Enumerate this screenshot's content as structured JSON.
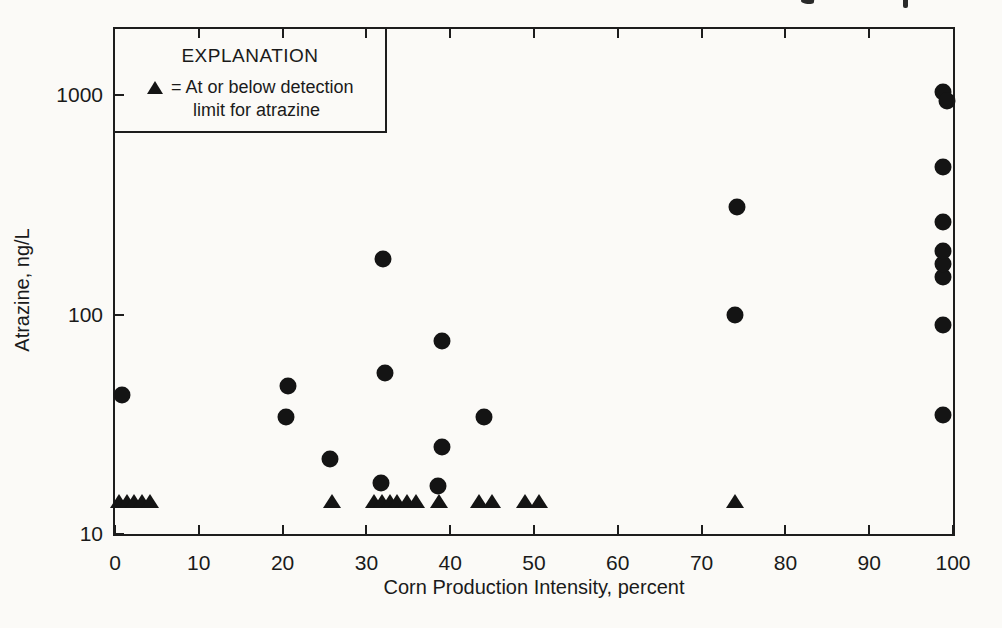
{
  "figure": {
    "legend": {
      "title": "EXPLANATION",
      "symbol": "filled-triangle-icon",
      "line1": "= At or below detection",
      "line2": "limit for atrazine"
    }
  },
  "chart_data": {
    "type": "scatter",
    "title": "",
    "xlabel": "Corn Production Intensity, percent",
    "ylabel": "Atrazine, ng/L",
    "x_scale": "linear",
    "y_scale": "log",
    "xlim": [
      0,
      100
    ],
    "ylim": [
      10,
      2000
    ],
    "x_ticks": [
      0,
      10,
      20,
      30,
      40,
      50,
      60,
      70,
      80,
      90,
      100
    ],
    "y_ticks": [
      10,
      100,
      1000
    ],
    "grid": false,
    "legend_position": "top-left-inside",
    "marker_color": "#141414",
    "series": [
      {
        "name": "Atrazine detections",
        "marker": "circle",
        "points": [
          [
            0.8,
            43
          ],
          [
            20.4,
            34
          ],
          [
            20.7,
            47
          ],
          [
            25.6,
            22
          ],
          [
            31.7,
            17
          ],
          [
            32.0,
            180
          ],
          [
            32.2,
            54
          ],
          [
            38.5,
            16.5
          ],
          [
            39.0,
            25
          ],
          [
            39.0,
            76
          ],
          [
            44.0,
            34
          ],
          [
            74.0,
            100
          ],
          [
            74.2,
            310
          ],
          [
            98.8,
            35
          ],
          [
            98.8,
            90
          ],
          [
            98.8,
            148
          ],
          [
            98.8,
            170
          ],
          [
            98.8,
            195
          ],
          [
            98.8,
            265
          ],
          [
            98.8,
            470
          ],
          [
            98.8,
            1030
          ],
          [
            99.3,
            940
          ]
        ]
      },
      {
        "name": "At or below detection limit for atrazine",
        "marker": "triangle",
        "points": [
          [
            0.5,
            14
          ],
          [
            1.4,
            14
          ],
          [
            2.3,
            14
          ],
          [
            3.2,
            14
          ],
          [
            4.2,
            14
          ],
          [
            25.9,
            14
          ],
          [
            30.9,
            14
          ],
          [
            31.9,
            14
          ],
          [
            32.8,
            14
          ],
          [
            33.7,
            14
          ],
          [
            34.8,
            14
          ],
          [
            35.9,
            14
          ],
          [
            38.7,
            14
          ],
          [
            43.4,
            14
          ],
          [
            45.0,
            14
          ],
          [
            48.9,
            14
          ],
          [
            50.6,
            14
          ],
          [
            74.0,
            14
          ]
        ]
      }
    ]
  }
}
